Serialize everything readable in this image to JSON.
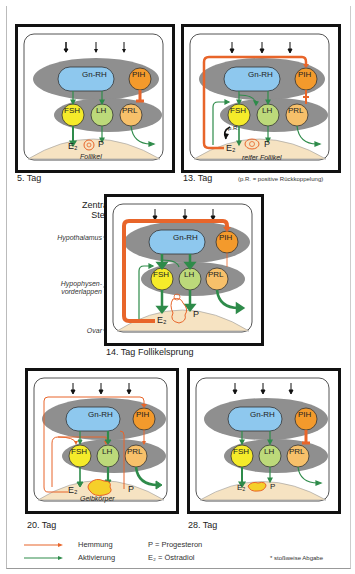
{
  "colors": {
    "inhibition": "#e8652a",
    "activation": "#2e8b4a",
    "hypothalamus_gray": "#8f8f8f",
    "gnrh_fill": "#8ec8ee",
    "pih_fill": "#f39a2c",
    "fsh_fill": "#f5eb2a",
    "lh_fill": "#bcd97a",
    "prl_fill": "#f7c06a",
    "ovary_fill": "#f6e3c2"
  },
  "nodes": {
    "gnrh": "Gn-RH",
    "pih": "PIH",
    "fsh": "FSH",
    "lh": "LH",
    "prl": "PRL",
    "e2": "E₂",
    "p": "P",
    "pr": "p.R."
  },
  "panels": [
    {
      "id": "day5",
      "caption": "5. Tag",
      "ovary_label": "Follikel"
    },
    {
      "id": "day13",
      "caption": "13. Tag",
      "ovary_label": "reifer Follikel",
      "note": "(p.R. = positive Rückkoppelung)"
    },
    {
      "id": "day14",
      "caption": "14. Tag",
      "subcaption": "Follikelsprung"
    },
    {
      "id": "day20",
      "caption": "20. Tag",
      "ovary_label": "Gelbkörper"
    },
    {
      "id": "day28",
      "caption": "28. Tag"
    }
  ],
  "side_labels": {
    "zns_line1": "Zentralnervöse",
    "zns_line2": "Steuerung",
    "hypothalamus": "Hypothalamus",
    "hvl_line1": "Hypophysen-",
    "hvl_line2": "vorderlappen",
    "ovar": "Ovar"
  },
  "legend": {
    "hemmung": "Hemmung",
    "aktivierung": "Aktivierung",
    "p_def": "P = Progesteron",
    "e2_def": "E₂ = Östradiol",
    "asterisk_note": "* stoßweise Abgabe"
  }
}
